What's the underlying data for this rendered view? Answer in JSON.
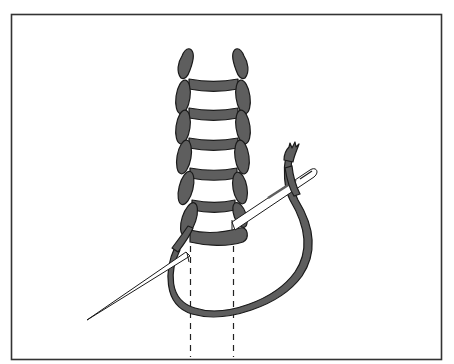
{
  "figure": {
    "title": "Ladder stitch illustration",
    "elements": {
      "stitch_rungs": 6,
      "needles": 2,
      "guide_lines": 2
    },
    "colors": {
      "thread": "#5e5e5e",
      "outline": "#1a1a1a",
      "background": "#ffffff",
      "frame": "#333333",
      "needle": "#ffffff"
    }
  }
}
